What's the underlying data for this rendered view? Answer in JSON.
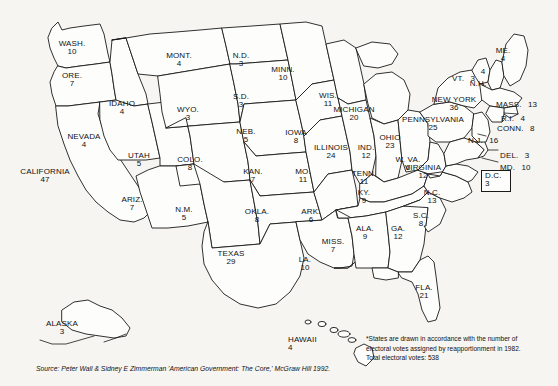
{
  "map": {
    "title": "United States Electoral Vote Map",
    "states": [
      {
        "code": "WA",
        "name": "WASH.",
        "votes": "10",
        "x": 68,
        "y": 44,
        "layout": "stack"
      },
      {
        "code": "OR",
        "name": "ORE.",
        "votes": "7",
        "x": 69,
        "y": 76,
        "layout": "stack"
      },
      {
        "code": "ID",
        "name": "IDAHO",
        "votes": "4",
        "x": 118,
        "y": 104,
        "layout": "stack"
      },
      {
        "code": "MT",
        "name": "MONT.",
        "votes": "4",
        "x": 176,
        "y": 56,
        "layout": "stack"
      },
      {
        "code": "WY",
        "name": "WYO.",
        "votes": "3",
        "x": 186,
        "y": 110,
        "layout": "stack"
      },
      {
        "code": "NV",
        "name": "NEVADA",
        "votes": "4",
        "x": 83,
        "y": 137,
        "layout": "stack"
      },
      {
        "code": "CA",
        "name": "CALIFORNIA",
        "votes": "47",
        "x": 36,
        "y": 172,
        "layout": "stack"
      },
      {
        "code": "UT",
        "name": "UTAH",
        "votes": "5",
        "x": 139,
        "y": 156,
        "layout": "stack"
      },
      {
        "code": "AZ",
        "name": "ARIZ.",
        "votes": "7",
        "x": 131,
        "y": 200,
        "layout": "stack"
      },
      {
        "code": "NM",
        "name": "N.M.",
        "votes": "5",
        "x": 184,
        "y": 210,
        "layout": "stack"
      },
      {
        "code": "CO",
        "name": "COLO.",
        "votes": "8",
        "x": 190,
        "y": 160,
        "layout": "stack"
      },
      {
        "code": "ND",
        "name": "N.D.",
        "votes": "3",
        "x": 241,
        "y": 56,
        "layout": "stack"
      },
      {
        "code": "SD",
        "name": "S.D.",
        "votes": "3",
        "x": 241,
        "y": 97,
        "layout": "stack"
      },
      {
        "code": "MN",
        "name": "MINN.",
        "votes": "10",
        "x": 283,
        "y": 70,
        "layout": "stack"
      },
      {
        "code": "NE",
        "name": "NEB.",
        "votes": "5",
        "x": 246,
        "y": 132,
        "layout": "stack"
      },
      {
        "code": "IA",
        "name": "IOWA",
        "votes": "8",
        "x": 296,
        "y": 133,
        "layout": "stack"
      },
      {
        "code": "KS",
        "name": "KAN.",
        "votes": "7",
        "x": 253,
        "y": 172,
        "layout": "stack"
      },
      {
        "code": "MO",
        "name": "MO.",
        "votes": "11",
        "x": 303,
        "y": 172,
        "layout": "stack"
      },
      {
        "code": "WI",
        "name": "WIS.",
        "votes": "11",
        "x": 328,
        "y": 96,
        "layout": "stack"
      },
      {
        "code": "MI",
        "name": "MICHIGAN",
        "votes": "20",
        "x": 354,
        "y": 110,
        "layout": "stack"
      },
      {
        "code": "IL",
        "name": "ILLINOIS",
        "votes": "24",
        "x": 331,
        "y": 148,
        "layout": "stack"
      },
      {
        "code": "IN",
        "name": "IND.",
        "votes": "12",
        "x": 364,
        "y": 148,
        "layout": "stack"
      },
      {
        "code": "OH",
        "name": "OHIO",
        "votes": "23",
        "x": 389,
        "y": 138,
        "layout": "stack"
      },
      {
        "code": "WV",
        "name": "W. VA.",
        "votes": "6",
        "x": 407,
        "y": 160,
        "layout": "stack"
      },
      {
        "code": "KY",
        "name": "KY.",
        "votes": "9",
        "x": 364,
        "y": 193,
        "layout": "stack"
      },
      {
        "code": "TN",
        "name": "TENN.",
        "votes": "11",
        "x": 364,
        "y": 174,
        "layout": "stack"
      },
      {
        "code": "VA",
        "name": "VIRGINIA",
        "votes": "12",
        "x": 423,
        "y": 168,
        "layout": "stack"
      },
      {
        "code": "NC",
        "name": "N.C.",
        "votes": "13",
        "x": 432,
        "y": 193,
        "layout": "stack"
      },
      {
        "code": "SC",
        "name": "S.C.",
        "votes": "8",
        "x": 421,
        "y": 216,
        "layout": "stack"
      },
      {
        "code": "GA",
        "name": "GA.",
        "votes": "12",
        "x": 398,
        "y": 229,
        "layout": "stack"
      },
      {
        "code": "FL",
        "name": "FLA.",
        "votes": "21",
        "x": 424,
        "y": 288,
        "layout": "stack"
      },
      {
        "code": "AL",
        "name": "ALA.",
        "votes": "9",
        "x": 365,
        "y": 229,
        "layout": "stack"
      },
      {
        "code": "MS",
        "name": "MISS.",
        "votes": "7",
        "x": 333,
        "y": 242,
        "layout": "stack"
      },
      {
        "code": "AR",
        "name": "ARK.",
        "votes": "6",
        "x": 311,
        "y": 212,
        "layout": "stack"
      },
      {
        "code": "LA",
        "name": "LA.",
        "votes": "10",
        "x": 305,
        "y": 260,
        "layout": "stack"
      },
      {
        "code": "OK",
        "name": "OKLA.",
        "votes": "8",
        "x": 257,
        "y": 212,
        "layout": "stack"
      },
      {
        "code": "TX",
        "name": "TEXAS",
        "votes": "29",
        "x": 231,
        "y": 254,
        "layout": "stack"
      },
      {
        "code": "ME",
        "name": "ME.",
        "votes": "4",
        "x": 503,
        "y": 51,
        "layout": "stack"
      },
      {
        "code": "VT",
        "name": "VT.",
        "votes": "3",
        "x": 462,
        "y": 70,
        "layout": "inline"
      },
      {
        "code": "NH",
        "name": "N.H.",
        "votes": "4",
        "x": 478,
        "y": 79,
        "layout": "stack"
      },
      {
        "code": "MA",
        "name": "MASS.",
        "votes": "13",
        "x": 508,
        "y": 98,
        "layout": "inline"
      },
      {
        "code": "RI",
        "name": "R.I.",
        "votes": "4",
        "x": 506,
        "y": 112,
        "layout": "inline"
      },
      {
        "code": "CT",
        "name": "CONN.",
        "votes": "8",
        "x": 506,
        "y": 122,
        "layout": "inline"
      },
      {
        "code": "NY",
        "name": "NEW YORK",
        "votes": "36",
        "x": 452,
        "y": 100,
        "layout": "stack"
      },
      {
        "code": "PA",
        "name": "PENNSYLVANIA",
        "votes": "25",
        "x": 433,
        "y": 120,
        "layout": "stack"
      },
      {
        "code": "NJ",
        "name": "N.J.",
        "votes": "16",
        "x": 479,
        "y": 133,
        "layout": "inline"
      },
      {
        "code": "DE",
        "name": "DEL.",
        "votes": "3",
        "x": 501,
        "y": 149,
        "layout": "inline"
      },
      {
        "code": "MD",
        "name": "MD.",
        "votes": "10",
        "x": 501,
        "y": 161,
        "layout": "inline"
      },
      {
        "code": "AK",
        "name": "ALASKA",
        "votes": "3",
        "x": 40,
        "y": 322,
        "layout": "stack"
      },
      {
        "code": "HI",
        "name": "HAWAII",
        "votes": "4",
        "x": 311,
        "y": 338,
        "layout": "stack"
      }
    ],
    "dc": {
      "name": "D.C.",
      "votes": "3",
      "x": 481,
      "y": 170,
      "w": 30,
      "h": 22
    }
  },
  "footnote": {
    "line1": "*States are drawn in accordance with the number of",
    "line2": "electoral votes assigned by reapportionment in 1982.",
    "line3": "Total electoral votes: 538"
  },
  "source": {
    "text": "Source: Peter Wall & Sidney E Zimmerman 'American Government: The Core,' McGraw Hill 1992."
  }
}
